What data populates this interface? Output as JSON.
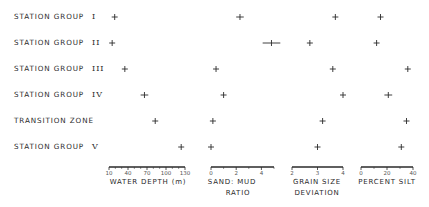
{
  "chart_data": {
    "type": "scatter",
    "title": "",
    "categories": [
      "STATION GROUP I",
      "STATION GROUP II",
      "STATION GROUP III",
      "STATION GROUP IV",
      "TRANSITION ZONE",
      "STATION GROUP V"
    ],
    "rows": [
      {
        "label": "STATION GROUP",
        "roman": "I"
      },
      {
        "label": "STATION GROUP",
        "roman": "II"
      },
      {
        "label": "STATION GROUP",
        "roman": "III"
      },
      {
        "label": "STATION GROUP",
        "roman": "IV"
      },
      {
        "label": "TRANSITION ZONE",
        "roman": ""
      },
      {
        "label": "STATION GROUP",
        "roman": "V"
      }
    ],
    "panels": [
      {
        "xlabel": "WATER DEPTH (m)",
        "xlabel_line2": "",
        "xlim": [
          10,
          130
        ],
        "ticks": [
          10,
          40,
          70,
          100,
          130
        ],
        "values": [
          19,
          15,
          35,
          66,
          83,
          124
        ],
        "error_halfwidth": [
          2,
          1,
          1,
          6,
          2,
          2
        ]
      },
      {
        "xlabel": "SAND: MUD",
        "xlabel_line2": "RATIO",
        "xlim": [
          0,
          5
        ],
        "ticks": [
          0,
          2,
          4
        ],
        "values": [
          2.3,
          4.8,
          0.4,
          1.0,
          0.15,
          0.0
        ],
        "error_halfwidth": [
          0.3,
          0.7,
          0.1,
          0.2,
          0.1,
          0.1
        ]
      },
      {
        "xlabel": "GRAIN SIZE",
        "xlabel_line2": "DEVIATION",
        "xlim": [
          2,
          4
        ],
        "ticks": [
          2,
          3,
          4
        ],
        "values": [
          3.7,
          2.7,
          3.6,
          4.0,
          3.2,
          3.0
        ],
        "error_halfwidth": [
          0.07,
          0.1,
          0.05,
          0.07,
          0.07,
          0.05
        ]
      },
      {
        "xlabel": "PERCENT SILT",
        "xlabel_line2": "",
        "xlim": [
          0,
          40
        ],
        "ticks": [
          0,
          20,
          40
        ],
        "values": [
          15,
          12,
          36,
          21,
          35,
          31
        ],
        "error_halfwidth": [
          2,
          2,
          2,
          3,
          2,
          1.5
        ]
      }
    ],
    "grid": false,
    "legend": "none"
  }
}
